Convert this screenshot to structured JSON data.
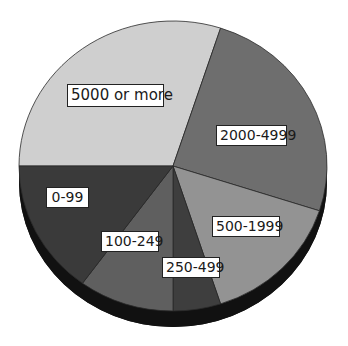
{
  "chart_data": {
    "type": "pie",
    "title": "",
    "style": "3d-pie",
    "categories": [
      "5000 or more",
      "2000-4999",
      "500-1999",
      "250-499",
      "100-249",
      "0-99"
    ],
    "values": [
      30,
      25,
      15,
      5,
      10,
      15
    ],
    "unit": "percent (estimated from slice angles)",
    "colors": [
      "#cfcfcf",
      "#6e6e6e",
      "#939393",
      "#3e3e3e",
      "#5f5f5f",
      "#3a3a3a"
    ],
    "start_angle_deg": -90,
    "direction": "clockwise",
    "legend": "none (labels placed on slices)"
  },
  "labels": {
    "s0": "5000 or more",
    "s1": "2000-4999",
    "s2": "500-1999",
    "s3": "250-499",
    "s4": "100-249",
    "s5": "0-99"
  }
}
